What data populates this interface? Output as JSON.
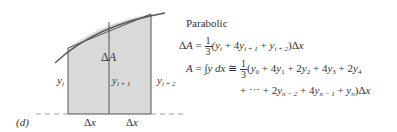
{
  "diagram": {
    "panel_label": "(d)",
    "area_label": "ΔA",
    "ordinates": [
      "y_i",
      "y_i+1",
      "y_i+2"
    ],
    "intervals": [
      "Δx",
      "Δx"
    ],
    "fill_color": "#d9d9d9",
    "line_color": "#555555"
  },
  "formula": {
    "title": "Parabolic",
    "line1_lhs": "ΔA =",
    "line1_frac_num": "1",
    "line1_frac_den": "3",
    "line1_rhs": "(yᵢ + 4yᵢ₊₁ + yᵢ₊₂)Δx",
    "line2_lhs": "A = ∫y dx ≅",
    "line2_frac_num": "1",
    "line2_frac_den": "3",
    "line2_rhs": "(y₀ + 4y₁ + 2y₂ + 4y₃ + 2y₄",
    "line3": "+ ⋯ + 2yₙ₋₂ + 4yₙ₋₁ + yₙ)Δx"
  }
}
